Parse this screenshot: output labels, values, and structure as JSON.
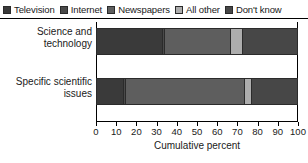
{
  "chart_data": {
    "type": "bar",
    "orientation": "horizontal",
    "stacked": true,
    "title": "",
    "xlabel": "Cumulative percent",
    "ylabel": "",
    "xlim": [
      0,
      100
    ],
    "xticks": [
      0,
      10,
      20,
      30,
      40,
      50,
      60,
      70,
      80,
      90,
      100
    ],
    "grid": false,
    "legend_position": "top",
    "categories": [
      "Science and technology",
      "Specific scientific issues"
    ],
    "series": [
      {
        "name": "Television",
        "color": "#3a3a3a",
        "values": [
          33,
          14
        ]
      },
      {
        "name": "Internet",
        "color": "#4a4a4a",
        "values": [
          1,
          1
        ]
      },
      {
        "name": "Newspapers",
        "color": "#5e5e5e",
        "values": [
          33,
          59
        ]
      },
      {
        "name": "All other",
        "color": "#adadad",
        "values": [
          6,
          3
        ]
      },
      {
        "name": "Don't know",
        "color": "#474747",
        "values": [
          27,
          23
        ]
      }
    ]
  },
  "legend": {
    "items": [
      {
        "label": "Television",
        "color": "#3a3a3a"
      },
      {
        "label": "Internet",
        "color": "#4a4a4a"
      },
      {
        "label": "Newspapers",
        "color": "#5e5e5e"
      },
      {
        "label": "All other",
        "color": "#adadad"
      },
      {
        "label": "Don't know",
        "color": "#474747"
      }
    ]
  },
  "axis": {
    "x_title": "Cumulative percent",
    "x_tick_labels": [
      "0",
      "10",
      "20",
      "30",
      "40",
      "50",
      "60",
      "70",
      "80",
      "90",
      "100"
    ]
  },
  "category_labels": [
    {
      "line1": "Science and",
      "line2": "technology"
    },
    {
      "line1": "Specific scientific",
      "line2": "issues"
    }
  ]
}
